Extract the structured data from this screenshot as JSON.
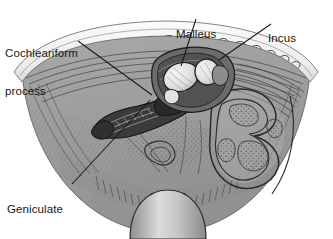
{
  "figure": {
    "kind": "anatomical-illustration",
    "background_color": "#ffffff",
    "ink_color": "#161616",
    "palette": {
      "body_gray": "#9d9d9d",
      "body_gray_dark": "#7e7e7e",
      "body_gray_light": "#b4b4b4",
      "bone_band": "#f2f2f2",
      "ossicle_highlight": "#e8e8e8",
      "shadow": "#5c5c5c",
      "deep_shadow": "#3a3a3a",
      "dome_light": "#d8d8d8",
      "dome_dark": "#8a8a8a"
    }
  },
  "labels": [
    {
      "id": "cochleariform",
      "name": "label-cochleariform-process",
      "line1": "Cochleariform",
      "line2": "process",
      "leader": "from label right edge down-right to the tensor tympani / cochleariform process on the dark facial nerve ridge"
    },
    {
      "id": "malleus",
      "name": "label-malleus",
      "line1": "Malleus",
      "line2": "",
      "leader": "from below label straight down to the malleus head"
    },
    {
      "id": "incus",
      "name": "label-incus",
      "line1": "Incus",
      "line2": "",
      "leader": "from below label down-left to the body of the incus"
    },
    {
      "id": "geniculate",
      "name": "label-geniculate-ganglion",
      "line1": "Geniculate",
      "line2": "ganglion",
      "leader": "from label upper right up-right to the geniculate ganglion on the facial nerve"
    }
  ],
  "structures": [
    {
      "name": "mastoid-air-cell-band",
      "description": "pale arc band across the top with stippled air-cell cluster marks"
    },
    {
      "name": "facial-nerve-ridge",
      "description": "dark elongated tapering ridge crossing the middle left to center"
    },
    {
      "name": "malleus-head",
      "description": "pale rounded ossicle left of center top"
    },
    {
      "name": "incus-body",
      "description": "pale rounded ossicle right of the malleus head"
    },
    {
      "name": "labyrinth-canals",
      "description": "looping outlined semicircular canal profiles on the right, stippled"
    },
    {
      "name": "promontory-floor",
      "description": "broad hatched gray floor of the tympanic cavity"
    },
    {
      "name": "jugular-dome",
      "description": "shaded dome at the bottom center"
    }
  ]
}
